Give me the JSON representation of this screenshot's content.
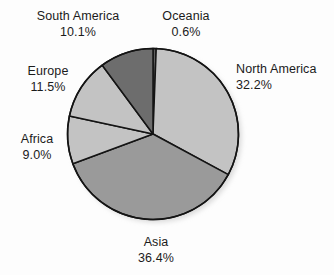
{
  "chart_data": {
    "type": "pie",
    "title": "",
    "subtitle": "",
    "xlabel": "",
    "ylabel": "",
    "legend_position": "none",
    "labels_position": "outside",
    "units": "percent",
    "start_angle_deg": 0,
    "direction": "clockwise",
    "categories": [
      "Oceania",
      "North America",
      "Asia",
      "Africa",
      "Europe",
      "South America"
    ],
    "values": [
      0.6,
      32.2,
      36.4,
      9.0,
      11.5,
      10.1
    ],
    "slices": [
      {
        "name": "Oceania",
        "value": 0.6,
        "value_label": "0.6%",
        "color": "#5f5f5f"
      },
      {
        "name": "North America",
        "value": 32.2,
        "value_label": "32.2%",
        "color": "#c3c3c3"
      },
      {
        "name": "Asia",
        "value": 36.4,
        "value_label": "36.4%",
        "color": "#9a9a9a"
      },
      {
        "name": "Africa",
        "value": 9.0,
        "value_label": "9.0%",
        "color": "#c3c3c3"
      },
      {
        "name": "Europe",
        "value": 11.5,
        "value_label": "11.5%",
        "color": "#c3c3c3"
      },
      {
        "name": "South America",
        "value": 10.1,
        "value_label": "10.1%",
        "color": "#6d6d6d"
      }
    ]
  },
  "labels": {
    "south_america": {
      "name": "South America",
      "value": "10.1%"
    },
    "oceania": {
      "name": "Oceania",
      "value": "0.6%"
    },
    "north_america": {
      "name": "North America",
      "value": "32.2%"
    },
    "europe": {
      "name": "Europe",
      "value": "11.5%"
    },
    "africa": {
      "name": "Africa",
      "value": "9.0%"
    },
    "asia": {
      "name": "Asia",
      "value": "36.4%"
    }
  },
  "colors": {
    "background": "#fdfdfd",
    "slice_outline": "#141414",
    "text": "#1b1b1b",
    "light_gray": "#c3c3c3",
    "medium_gray": "#9a9a9a",
    "dark_gray": "#6d6d6d",
    "darkest_gray": "#5f5f5f",
    "shadow": "#e8e8e8"
  }
}
